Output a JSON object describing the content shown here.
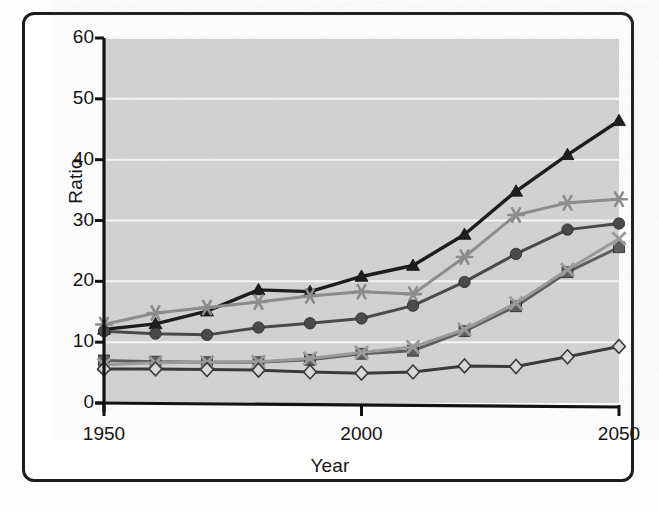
{
  "chart_data": {
    "type": "line",
    "title": "",
    "xlabel": "Year",
    "ylabel": "Ratio",
    "xlim": [
      1950,
      2050
    ],
    "ylim": [
      0,
      60
    ],
    "ytick_values": [
      0,
      10,
      20,
      30,
      40,
      50,
      60
    ],
    "ytick_labels": [
      "0",
      "10",
      "20",
      "30",
      "40",
      "50",
      "60"
    ],
    "xtick_values": [
      1950,
      2000,
      2050
    ],
    "xtick_labels": [
      "1950",
      "2000",
      "2050"
    ],
    "grid": "horizontal-white",
    "legend": "none",
    "plot_background": "#d2d2d2",
    "x": [
      1950,
      1960,
      1970,
      1980,
      1990,
      2000,
      2010,
      2020,
      2030,
      2040,
      2050
    ],
    "series": [
      {
        "name": "series-triangle",
        "marker": "triangle",
        "color": "#1d1d1d",
        "values": [
          12.1,
          13.0,
          15.1,
          18.6,
          18.3,
          20.8,
          22.6,
          27.7,
          34.8,
          40.8,
          46.4
        ]
      },
      {
        "name": "series-asterisk",
        "marker": "asterisk",
        "color": "#8c8c8c",
        "values": [
          12.9,
          14.8,
          15.7,
          16.6,
          17.6,
          18.3,
          17.9,
          24.0,
          30.9,
          32.9,
          33.5
        ]
      },
      {
        "name": "series-circle",
        "marker": "circle",
        "color": "#4a4a4a",
        "values": [
          11.8,
          11.4,
          11.2,
          12.4,
          13.1,
          13.9,
          16.0,
          19.9,
          24.5,
          28.5,
          29.5
        ]
      },
      {
        "name": "series-square",
        "marker": "square",
        "color": "#5d5d5d",
        "values": [
          7.0,
          6.8,
          6.7,
          6.7,
          7.1,
          8.1,
          8.6,
          11.8,
          15.9,
          21.5,
          25.6
        ]
      },
      {
        "name": "series-cross",
        "marker": "cross",
        "color": "#9a9a9a",
        "values": [
          6.3,
          6.6,
          6.7,
          6.8,
          7.3,
          8.3,
          9.2,
          12.1,
          16.4,
          21.9,
          27.0
        ]
      },
      {
        "name": "series-diamond",
        "marker": "diamond",
        "color": "#3a3a3a",
        "values": [
          5.6,
          5.6,
          5.5,
          5.4,
          5.1,
          4.9,
          5.1,
          6.1,
          6.0,
          7.6,
          9.3
        ]
      }
    ]
  }
}
